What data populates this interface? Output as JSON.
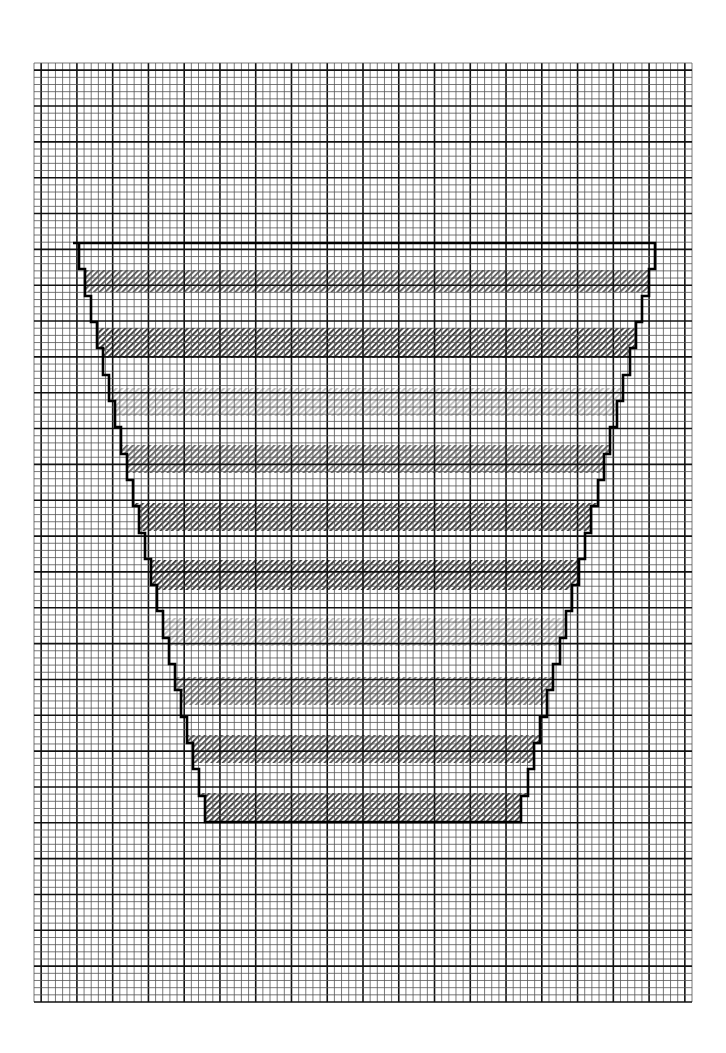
{
  "chart": {
    "kind": "cross-stitch pattern on graph paper",
    "grid": {
      "left": 34,
      "top": 63,
      "right": 692,
      "bottom": 1002,
      "cell": 7.15,
      "major_every": 5,
      "minor_color": "#555555",
      "major_color": "#111111"
    },
    "vase": {
      "outline_color": "#000000",
      "top_y": 243,
      "bottom_y": 822,
      "top_left_x": 73,
      "top_right_x": 655,
      "bottom_left_x": 205,
      "bottom_right_x": 515,
      "steps": 22
    },
    "bands": [
      {
        "y0": 270,
        "y1": 292,
        "tone": "medium",
        "color": "#555555"
      },
      {
        "y0": 328,
        "y1": 358,
        "tone": "dark",
        "color": "#333333"
      },
      {
        "y0": 388,
        "y1": 416,
        "tone": "light",
        "color": "#bbbbbb"
      },
      {
        "y0": 445,
        "y1": 473,
        "tone": "medium",
        "color": "#666666"
      },
      {
        "y0": 503,
        "y1": 531,
        "tone": "dark",
        "color": "#333333"
      },
      {
        "y0": 560,
        "y1": 590,
        "tone": "dark",
        "color": "#2e2e2e"
      },
      {
        "y0": 618,
        "y1": 646,
        "tone": "light",
        "color": "#bbbbbb"
      },
      {
        "y0": 677,
        "y1": 705,
        "tone": "medium",
        "color": "#777777"
      },
      {
        "y0": 735,
        "y1": 763,
        "tone": "medium",
        "color": "#4a4a4a"
      },
      {
        "y0": 793,
        "y1": 822,
        "tone": "dark",
        "color": "#3a3a3a"
      }
    ]
  }
}
